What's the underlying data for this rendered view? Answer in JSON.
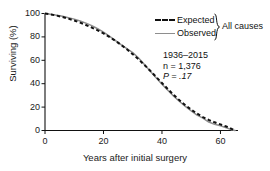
{
  "chart_data": {
    "type": "line",
    "title": "",
    "subtitle": "",
    "xlabel": "Years after initial surgery",
    "ylabel": "Surviving (%)",
    "xlim": [
      0,
      66
    ],
    "ylim": [
      0,
      100
    ],
    "xticks": [
      0,
      20,
      40,
      60
    ],
    "yticks": [
      0,
      20,
      40,
      60,
      80,
      100
    ],
    "xtick_labels": [
      "0",
      "20",
      "40",
      "60"
    ],
    "ytick_labels": [
      "0",
      "20",
      "40",
      "60",
      "80",
      "100"
    ],
    "grid": false,
    "legend_position": "top-right",
    "legend_group_label": "All causes",
    "series": [
      {
        "name": "Expected",
        "style": "dashed",
        "color": "#111111",
        "x": [
          0,
          2,
          4,
          6,
          8,
          10,
          12,
          14,
          16,
          18,
          20,
          22,
          24,
          26,
          28,
          30,
          32,
          34,
          36,
          38,
          40,
          42,
          44,
          46,
          48,
          50,
          52,
          54,
          56,
          58,
          60,
          62,
          64,
          65
        ],
        "y": [
          100,
          99.2,
          98.2,
          97.0,
          95.6,
          94.0,
          92.2,
          90.2,
          88.0,
          85.6,
          83.0,
          80.0,
          76.8,
          73.2,
          69.4,
          65.2,
          60.8,
          56.0,
          51.0,
          45.8,
          40.6,
          35.4,
          30.4,
          25.8,
          21.6,
          17.8,
          14.4,
          11.5,
          9.0,
          7.0,
          5.2,
          3.4,
          1.2,
          0
        ]
      },
      {
        "name": "Observed",
        "style": "solid",
        "color": "#8e8e8e",
        "x": [
          0,
          2,
          4,
          6,
          8,
          10,
          12,
          14,
          16,
          18,
          20,
          22,
          24,
          26,
          28,
          30,
          32,
          34,
          36,
          38,
          40,
          42,
          44,
          46,
          48,
          50,
          52,
          54,
          56,
          58,
          60,
          62,
          63,
          64,
          65
        ],
        "y": [
          100,
          99.4,
          98.6,
          97.6,
          96.4,
          95.2,
          93.6,
          91.8,
          89.6,
          87.0,
          84.0,
          80.6,
          77.0,
          73.4,
          70.0,
          66.6,
          62.0,
          56.4,
          50.6,
          45.0,
          39.6,
          34.4,
          29.4,
          24.8,
          20.6,
          16.8,
          13.2,
          10.6,
          7.2,
          5.4,
          4.0,
          2.4,
          1.4,
          0.4,
          0
        ]
      }
    ],
    "annotations": [
      "1936–2015",
      "n = 1,376",
      "P = .17"
    ],
    "annotation_lines": {
      "period": "1936–2015",
      "n": "n = 1,376",
      "p": "P = .17"
    }
  },
  "legend": {
    "items": [
      {
        "label": "Expected",
        "style": "dashed"
      },
      {
        "label": "Observed",
        "style": "solid"
      }
    ],
    "group_label": "All causes"
  },
  "axes": {
    "x_title": "Years after initial surgery",
    "y_title": "Surviving (%)"
  },
  "colors": {
    "expected": "#111111",
    "observed": "#8e8e8e",
    "axis": "#111111",
    "background": "#ffffff"
  }
}
